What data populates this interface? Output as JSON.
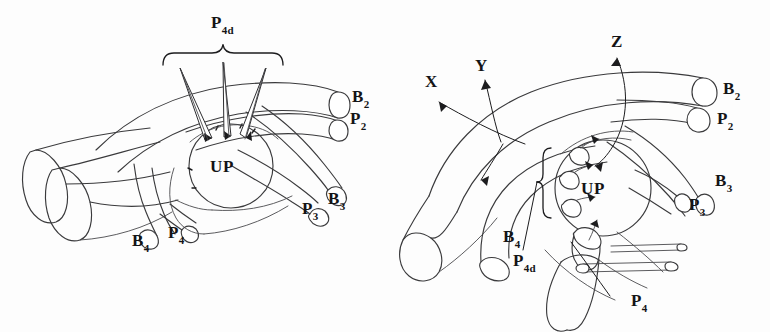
{
  "figure": {
    "background_color": "#fdfdfd",
    "ink_color": "#2d2d30",
    "panel_count": 2
  },
  "panels": [
    {
      "id": "panel-left",
      "center_structure": {
        "label": "UP"
      },
      "bracket": {
        "label_main": "P",
        "label_sub": "4d"
      },
      "labels": [
        {
          "name": "label-b2",
          "main": "B",
          "sub": "2"
        },
        {
          "name": "label-p2",
          "main": "P",
          "sub": "2"
        },
        {
          "name": "label-p3",
          "main": "P",
          "sub": "3"
        },
        {
          "name": "label-b3",
          "main": "B",
          "sub": "3"
        },
        {
          "name": "label-b4",
          "main": "B",
          "sub": "4"
        },
        {
          "name": "label-p4",
          "main": "P",
          "sub": "4"
        }
      ],
      "needle_branch_count": 3
    },
    {
      "id": "panel-right",
      "center_structure": {
        "label": "UP"
      },
      "bracket": {
        "label_main": "P",
        "label_sub": "4d"
      },
      "axis_labels": [
        {
          "name": "label-x",
          "text": "X"
        },
        {
          "name": "label-y",
          "text": "Y"
        },
        {
          "name": "label-z",
          "text": "Z"
        }
      ],
      "labels": [
        {
          "name": "label-b2",
          "main": "B",
          "sub": "2"
        },
        {
          "name": "label-p2",
          "main": "P",
          "sub": "2"
        },
        {
          "name": "label-b3",
          "main": "B",
          "sub": "3"
        },
        {
          "name": "label-p3",
          "main": "P",
          "sub": "3"
        },
        {
          "name": "label-b4",
          "main": "B",
          "sub": "4"
        },
        {
          "name": "label-p4d-main",
          "main": "P",
          "sub": "4d"
        },
        {
          "name": "label-p4",
          "main": "P",
          "sub": "4"
        }
      ],
      "stub_branch_count": 3
    }
  ]
}
